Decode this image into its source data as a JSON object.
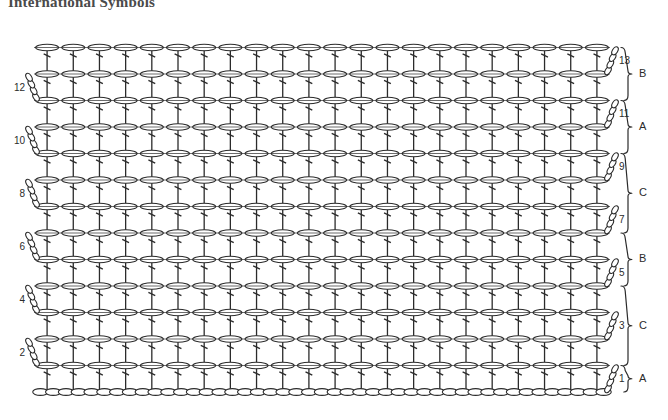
{
  "page": {
    "title": "International Symbols",
    "background_color": "#ffffff",
    "ink_color": "#2b2b2b",
    "title_color": "#4a4a4a"
  },
  "chart_data": {
    "type": "diagram",
    "diagram_kind": "crochet-stitch-chart",
    "title": "International Symbols",
    "rows_total": 13,
    "columns_total": 22,
    "foundation_chain_stitches": 45,
    "stitch_symbols": {
      "chain": "oval",
      "double_crochet": "vertical-line-with-crossbar",
      "turning_chain": "diagonal-chain-stack"
    },
    "left_row_numbers": [
      12,
      10,
      8,
      6,
      4,
      2
    ],
    "right_row_numbers": [
      13,
      11,
      9,
      7,
      5,
      3,
      1
    ],
    "section_brackets": [
      {
        "label": "B",
        "from_row": 12,
        "to_row": 13
      },
      {
        "label": "A",
        "from_row": 10,
        "to_row": 11
      },
      {
        "label": "C",
        "from_row": 7,
        "to_row": 9
      },
      {
        "label": "B",
        "from_row": 5,
        "to_row": 6
      },
      {
        "label": "C",
        "from_row": 2,
        "to_row": 4
      },
      {
        "label": "A",
        "from_row": 1,
        "to_row": 1
      }
    ],
    "turning_chain_side_by_row": {
      "1": "right",
      "2": "left",
      "3": "right",
      "4": "left",
      "5": "right",
      "6": "left",
      "7": "right",
      "8": "left",
      "9": "right",
      "10": "left",
      "11": "right",
      "12": "left",
      "13": "right"
    },
    "geometry": {
      "grid_left": 34,
      "grid_right": 610,
      "row_height": 26.5,
      "baseline_y": 392,
      "column_spacing": 26.2
    }
  }
}
